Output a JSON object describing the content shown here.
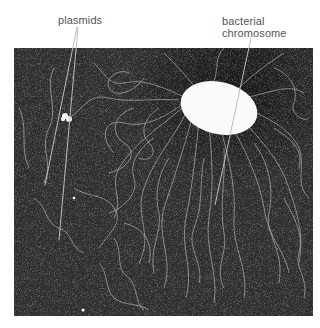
{
  "figure": {
    "labels": {
      "plasmids": "plasmids",
      "chromosome_line1": "bacterial",
      "chromosome_line2": "chromosome"
    },
    "image": {
      "subject": "electron micrograph of lysed bacterial cell",
      "background_color": "#2c2c2c",
      "fiber_color": "#c8c8c8",
      "chromosome_color": "#fafafa"
    },
    "label_color": "#555555",
    "leader_color": "#bdbdbd"
  }
}
